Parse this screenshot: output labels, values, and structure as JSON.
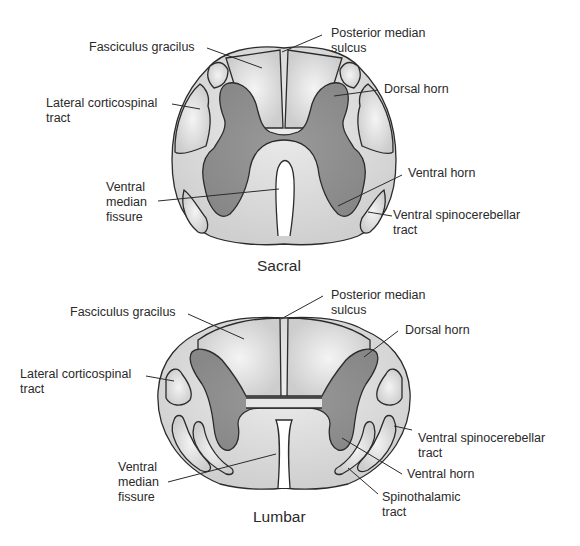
{
  "sacral": {
    "title": "Sacral",
    "labels": {
      "fasciculus_gracilus": "Fasciculus gracilus",
      "posterior_median_sulcus": "Posterior median\nsulcus",
      "lateral_corticospinal": "Lateral corticospinal\ntract",
      "dorsal_horn": "Dorsal horn",
      "ventral_median_fissure": "Ventral\nmedian\nfissure",
      "ventral_horn": "Ventral horn",
      "ventral_spinocerebellar": "Ventral spinocerebellar\ntract"
    }
  },
  "lumbar": {
    "title": "Lumbar",
    "labels": {
      "fasciculus_gracilus": "Fasciculus gracilus",
      "posterior_median_sulcus": "Posterior median\nsulcus",
      "lateral_corticospinal": "Lateral corticospinal\ntract",
      "dorsal_horn": "Dorsal horn",
      "ventral_spinocerebellar": "Ventral spinocerebellar\ntract",
      "ventral_median_fissure": "Ventral\nmedian\nfissure",
      "ventral_horn": "Ventral horn",
      "spinothalamic": "Spinothalamic\ntract"
    }
  },
  "colors": {
    "white_matter": "#d4d4d4",
    "gray_matter": "#8e8e8e",
    "outline": "#2b2b2b",
    "highlight": "#f2f2f2"
  }
}
